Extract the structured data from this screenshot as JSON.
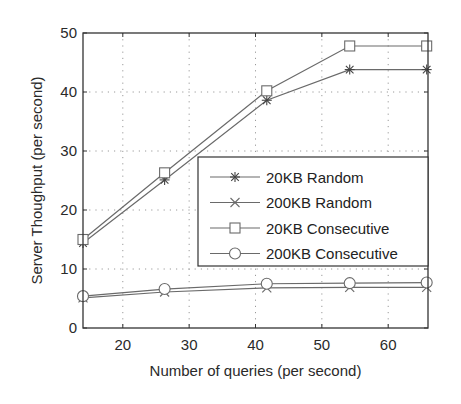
{
  "chart_data": {
    "type": "line",
    "title": "",
    "xlabel": "Number of queries (per second)",
    "ylabel": "Server Thoughput (per second)",
    "xlim": [
      14,
      66
    ],
    "ylim": [
      0,
      50
    ],
    "xticks": [
      20,
      30,
      40,
      50,
      60
    ],
    "yticks": [
      0,
      10,
      20,
      30,
      40,
      50
    ],
    "grid": true,
    "legend_position": "center-right",
    "x": [
      14,
      26.3,
      41.7,
      54.2,
      65.8
    ],
    "series": [
      {
        "name": "20KB Random",
        "marker": "asterisk",
        "values": [
          14.4,
          25.1,
          38.6,
          43.8,
          43.8
        ]
      },
      {
        "name": "200KB Random",
        "marker": "x",
        "values": [
          5.1,
          6.1,
          6.8,
          6.9,
          6.9
        ]
      },
      {
        "name": "20KB Consecutive",
        "marker": "square",
        "values": [
          15.0,
          26.3,
          40.2,
          47.8,
          47.8
        ]
      },
      {
        "name": "200KB Consecutive",
        "marker": "circle",
        "values": [
          5.4,
          6.6,
          7.5,
          7.6,
          7.7
        ]
      }
    ]
  },
  "colors": {
    "line": "#6a6a6a",
    "axis": "#333333",
    "grid": "#9a9a9a"
  }
}
